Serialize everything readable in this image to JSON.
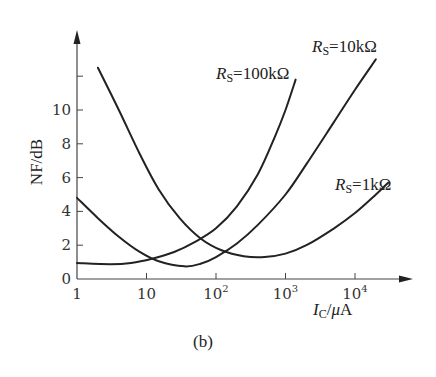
{
  "chart_data": {
    "type": "line",
    "title": "",
    "caption": "(b)",
    "xlabel": "I_C/μA",
    "ylabel": "NF/dB",
    "xscale": "log",
    "xlim": [
      1,
      100000
    ],
    "ylim": [
      0,
      13
    ],
    "x_ticks": [
      {
        "value": 1,
        "label": "1"
      },
      {
        "value": 10,
        "label": "10"
      },
      {
        "value": 100,
        "label": "10",
        "sup": "2"
      },
      {
        "value": 1000,
        "label": "10",
        "sup": "3"
      },
      {
        "value": 10000,
        "label": "10",
        "sup": "4"
      }
    ],
    "y_ticks": [
      0,
      2,
      4,
      6,
      8,
      10,
      12
    ],
    "y_tick_labels": [
      "0",
      "2",
      "4",
      "6",
      "8",
      "10",
      ""
    ],
    "grid": false,
    "series": [
      {
        "name": "R_S=1kΩ",
        "label_main": "R",
        "label_sub": "S",
        "label_rest": "=1kΩ",
        "points": [
          [
            2,
            12.5
          ],
          [
            4,
            10
          ],
          [
            8,
            7.4
          ],
          [
            15,
            5.3
          ],
          [
            30,
            3.6
          ],
          [
            60,
            2.4
          ],
          [
            120,
            1.7
          ],
          [
            250,
            1.35
          ],
          [
            500,
            1.3
          ],
          [
            1000,
            1.5
          ],
          [
            2000,
            2.0
          ],
          [
            5000,
            3.0
          ],
          [
            10000,
            3.9
          ],
          [
            20000,
            5.0
          ],
          [
            30000,
            5.7
          ]
        ]
      },
      {
        "name": "R_S=10kΩ",
        "label_main": "R",
        "label_sub": "S",
        "label_rest": "=10kΩ",
        "points": [
          [
            1,
            4.8
          ],
          [
            2,
            3.6
          ],
          [
            4,
            2.5
          ],
          [
            8,
            1.6
          ],
          [
            15,
            1.05
          ],
          [
            35,
            0.75
          ],
          [
            60,
            0.9
          ],
          [
            100,
            1.3
          ],
          [
            200,
            2.1
          ],
          [
            400,
            3.2
          ],
          [
            1000,
            5.0
          ],
          [
            2000,
            6.8
          ],
          [
            5000,
            9.3
          ],
          [
            10000,
            11.2
          ],
          [
            20000,
            13.0
          ]
        ]
      },
      {
        "name": "R_S=100kΩ",
        "label_main": "R",
        "label_sub": "S",
        "label_rest": "=100kΩ",
        "points": [
          [
            1,
            0.95
          ],
          [
            3,
            0.88
          ],
          [
            6,
            0.95
          ],
          [
            12,
            1.2
          ],
          [
            25,
            1.6
          ],
          [
            50,
            2.2
          ],
          [
            100,
            3.0
          ],
          [
            200,
            4.3
          ],
          [
            400,
            6.2
          ],
          [
            700,
            8.4
          ],
          [
            1000,
            10.0
          ],
          [
            1400,
            11.8
          ]
        ]
      }
    ]
  }
}
